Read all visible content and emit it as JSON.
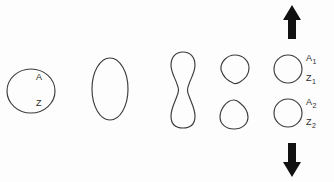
{
  "figure": {
    "background_color": "#fdfdfd",
    "stroke_color": "#3b3b3b",
    "arrow_color": "#111111",
    "width": 334,
    "height": 182
  },
  "labels": {
    "parent_nucleus": "A",
    "parent_cytoplasm": "Z",
    "daughter1_nucleus": "A",
    "daughter1_nucleus_sub": "1",
    "daughter1_cytoplasm": "Z",
    "daughter1_cytoplasm_sub": "1",
    "daughter2_nucleus": "A",
    "daughter2_nucleus_sub": "2",
    "daughter2_cytoplasm": "Z",
    "daughter2_cytoplasm_sub": "2"
  },
  "stages": [
    {
      "index": 1,
      "name": "parent-cell",
      "shape": "circle",
      "description": "Round parent cell labelled A and Z",
      "cx": 31,
      "cy": 91,
      "rx": 24,
      "ry": 22
    },
    {
      "index": 2,
      "name": "elongated-cell",
      "shape": "ellipse",
      "description": "Cell elongated along the vertical axis",
      "cx": 110,
      "cy": 89,
      "rx": 18,
      "ry": 31
    },
    {
      "index": 3,
      "name": "constricting-cell",
      "shape": "dumbbell",
      "description": "Cell constricted at the equator forming a cleavage furrow",
      "cx": 183,
      "cy": 90,
      "half_width": 11,
      "top": 52,
      "bottom": 128,
      "waist_half_width": 6
    },
    {
      "index": 4,
      "name": "separating-daughter-cells",
      "shape": "two-teardrops",
      "description": "Two daughter cells just after separation, still pointed at the former furrow"
    },
    {
      "index": 5,
      "name": "separated-daughter-cells",
      "shape": "two-circles",
      "description": "Two fully rounded daughter cells moving apart",
      "upper": {
        "cx": 288,
        "cy": 69,
        "r": 14
      },
      "lower": {
        "cx": 288,
        "cy": 113,
        "r": 14
      }
    }
  ],
  "arrows": [
    {
      "name": "up-arrow",
      "direction": "up",
      "description": "Direction of movement of the upper daughter cell",
      "x": 292,
      "top": 5,
      "bottom": 39
    },
    {
      "name": "down-arrow",
      "direction": "down",
      "description": "Direction of movement of the lower daughter cell",
      "x": 292,
      "top": 143,
      "bottom": 177
    }
  ]
}
